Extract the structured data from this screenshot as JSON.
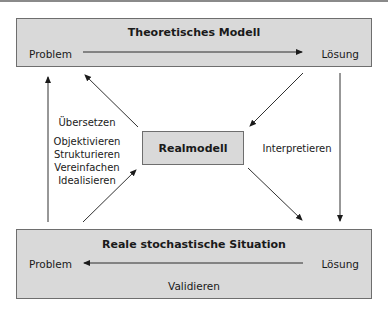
{
  "diagram": {
    "top_box": {
      "title": "Theoretisches Modell",
      "left_label": "Problem",
      "right_label": "Lösung",
      "arrow_direction": "left-to-right"
    },
    "center_box": {
      "title": "Realmodell"
    },
    "bottom_box": {
      "title": "Reale stochastische Situation",
      "left_label": "Problem",
      "right_label": "Lösung",
      "bottom_label": "Validieren",
      "arrow_direction": "right-to-left"
    },
    "left_annotations": {
      "heading": "Übersetzen",
      "steps": [
        "Objektivieren",
        "Strukturieren",
        "Vereinfachen",
        "Idealisieren"
      ]
    },
    "right_annotation": "Interpretieren",
    "colors": {
      "box_fill": "#d9d9d9",
      "box_border": "#6e6e6e",
      "arrow": "#1a1a1a"
    }
  }
}
